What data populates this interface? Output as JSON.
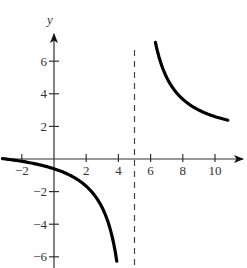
{
  "chart_data": {
    "type": "line",
    "title": "",
    "xlabel": "",
    "ylabel": "y",
    "function": "y = (x + 3) / (x - 5)",
    "xlim": [
      -3.3,
      11.8
    ],
    "ylim": [
      -6.6,
      7.8
    ],
    "grid": false,
    "legend": null,
    "x_ticks": [
      -2,
      2,
      4,
      6,
      8,
      10
    ],
    "x_tick_labels": [
      "−2",
      "2",
      "4",
      "6",
      "8",
      "10"
    ],
    "y_ticks": [
      6,
      4,
      2,
      -2,
      -4,
      -6
    ],
    "y_tick_labels": [
      "6",
      "4",
      "2",
      "−2",
      "−4",
      "−6"
    ],
    "asymptotes": [
      {
        "type": "vertical",
        "x": 5,
        "style": "dashed"
      }
    ],
    "series": [
      {
        "name": "left branch",
        "x": [
          -3.2,
          -3,
          -2,
          -1,
          0,
          1,
          2,
          3,
          3.5,
          3.9
        ],
        "y": [
          0.02,
          0,
          -0.14,
          -0.33,
          -0.6,
          -1.0,
          -1.67,
          -3.0,
          -4.33,
          -6.27
        ]
      },
      {
        "name": "right branch",
        "x": [
          6.3,
          6.5,
          7,
          7.5,
          8,
          9,
          10,
          10.8
        ],
        "y": [
          7.15,
          6.33,
          5.0,
          4.2,
          3.67,
          3.0,
          2.6,
          2.38
        ]
      }
    ]
  },
  "axes": {
    "y_label": "y"
  }
}
